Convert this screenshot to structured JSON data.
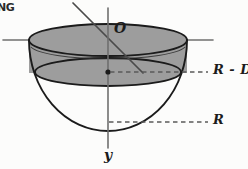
{
  "figure": {
    "background_color": "#fcfcfb",
    "ink_color": "#1b1b1b",
    "shade_color": "#9a9a9a",
    "axis_color": "#6f6f6f"
  },
  "labels": {
    "corner_note": "NG",
    "origin": "O",
    "level_upper": "R - D",
    "level_lower": "R",
    "axis_vertical": "y"
  },
  "geometry": {
    "center_x": 108,
    "rim_y": 40,
    "rim_rx": 79,
    "rim_ry": 16,
    "inner_ellipse_y": 72,
    "inner_rx": 73,
    "inner_ry": 14,
    "bowl_bottom_y": 131,
    "dot_x": 108,
    "dot_y": 72,
    "dash_upper_y": 72,
    "dash_lower_y": 122,
    "dash_x_start": 110,
    "dash_x_end": 208,
    "y_axis_top": 8,
    "y_axis_bottom": 148,
    "h_axis_left": 3,
    "h_axis_right": 213,
    "oblique_x1": 73,
    "oblique_y1": 3,
    "oblique_x2": 143,
    "oblique_y2": 73
  },
  "annotations": {
    "shaded_region": "region between rim plane and depth plane (liquid / removed cap)",
    "unshaded_region": "lower spherical cap below the R - D level"
  }
}
